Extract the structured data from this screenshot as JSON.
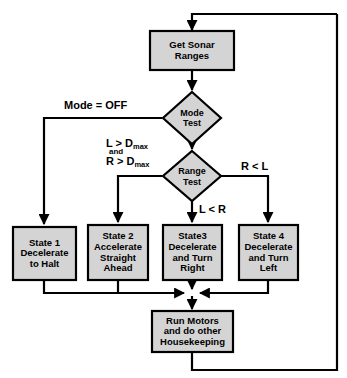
{
  "diagram": {
    "style": {
      "shape_fill": "#d4d4d4",
      "shape_stroke": "#000000",
      "line_color": "#000000",
      "background": "#ffffff"
    },
    "nodes": [
      {
        "id": "get-sonar-ranges",
        "type": "process",
        "lines": [
          "Get Sonar",
          "Ranges"
        ]
      },
      {
        "id": "mode-test",
        "type": "decision",
        "lines": [
          "Mode",
          "Test"
        ]
      },
      {
        "id": "range-test",
        "type": "decision",
        "lines": [
          "Range",
          "Test"
        ]
      },
      {
        "id": "state-1",
        "type": "process",
        "lines": [
          "State 1",
          "Decelerate",
          "to Halt"
        ]
      },
      {
        "id": "state-2",
        "type": "process",
        "lines": [
          "State 2",
          "Accelerate",
          "Straight",
          "Ahead"
        ]
      },
      {
        "id": "state-3",
        "type": "process",
        "lines": [
          "State3",
          "Decelerate",
          "and Turn",
          "Right"
        ]
      },
      {
        "id": "state-4",
        "type": "process",
        "lines": [
          "State 4",
          "Decelerate",
          "and Turn",
          "Left"
        ]
      },
      {
        "id": "run-motors",
        "type": "process",
        "lines": [
          "Run Motors",
          "and do other",
          "Housekeeping"
        ]
      }
    ],
    "edge_labels": {
      "mode_off": "Mode = OFF",
      "range_both_max_line1_pre": "L > D",
      "range_both_max_sub1": "max",
      "range_both_max_and": "and",
      "range_both_max_line2_pre": "R > D",
      "range_both_max_sub2": "max",
      "r_less_l": "R < L",
      "l_less_r": "L < R"
    }
  }
}
